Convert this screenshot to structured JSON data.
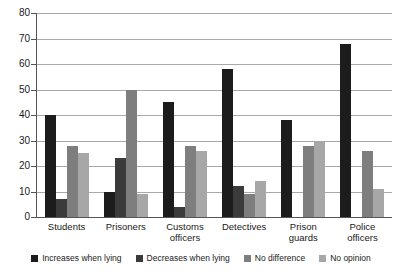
{
  "chart_data": {
    "type": "bar",
    "title": "",
    "subtitle": "",
    "xlabel": "",
    "ylabel": "",
    "ylim": [
      0,
      80
    ],
    "ytick_step": 10,
    "yticks": [
      0,
      10,
      20,
      30,
      40,
      50,
      60,
      70,
      80
    ],
    "grid": true,
    "legend_position": "bottom",
    "categories": [
      "Students",
      "Prisoners",
      "Customs officers",
      "Detectives",
      "Prison guards",
      "Police officers"
    ],
    "category_lines": [
      [
        "Students"
      ],
      [
        "Prisoners"
      ],
      [
        "Customs",
        "officers"
      ],
      [
        "Detectives"
      ],
      [
        "Prison",
        "guards"
      ],
      [
        "Police",
        "officers"
      ]
    ],
    "series": [
      {
        "name": "Increases when lying",
        "color": "#1c1c1c",
        "values": [
          40,
          10,
          45,
          58,
          38,
          68
        ]
      },
      {
        "name": "Decreases when lying",
        "color": "#3b3b3b",
        "values": [
          7,
          23,
          4,
          12,
          0,
          0
        ]
      },
      {
        "name": "No difference",
        "color": "#7e7e7e",
        "values": [
          28,
          50,
          28,
          9,
          28,
          26
        ]
      },
      {
        "name": "No opinion",
        "color": "#a7a7a7",
        "values": [
          25,
          9,
          26,
          14,
          30,
          11
        ]
      }
    ]
  },
  "legend": {
    "items": [
      {
        "label": "Increases when lying"
      },
      {
        "label": "Decreases when lying"
      },
      {
        "label": "No difference"
      },
      {
        "label": "No opinion"
      }
    ]
  },
  "colors": {
    "series_1": "#1c1c1c",
    "series_2": "#3b3b3b",
    "series_3": "#7e7e7e",
    "series_4": "#a7a7a7",
    "axis": "#555555",
    "grid": "#a8a8a8",
    "background": "#ffffff"
  }
}
